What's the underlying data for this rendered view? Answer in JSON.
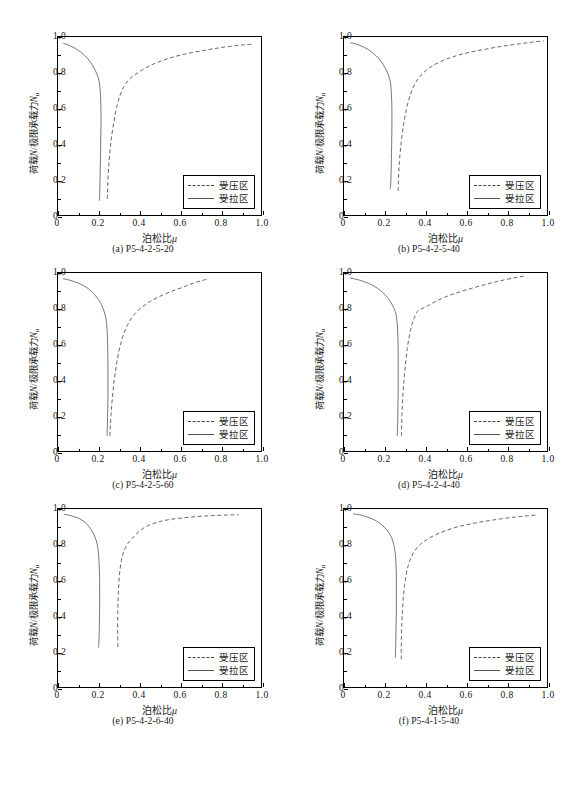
{
  "figure": {
    "axis": {
      "xlabel_cn": "泊松比",
      "xlabel_sym": "μ",
      "ylabel_cn_a": "荷载",
      "ylabel_sym_n": "N",
      "ylabel_slash": "/",
      "ylabel_cn_b": "极限承载力",
      "ylabel_sym_nu": "N",
      "ylabel_sub_u": "u",
      "xticks": [
        "0",
        "0.2",
        "0.4",
        "0.6",
        "0.8",
        "1.0"
      ],
      "yticks": [
        "0",
        "0.2",
        "0.4",
        "0.6",
        "0.8",
        "1.0"
      ]
    },
    "legend": {
      "compression": "受压区",
      "tension": "受拉区"
    },
    "colors": {
      "axis": "#000000",
      "compression_curve": "#555555",
      "tension_curve": "#666666",
      "background": "#ffffff"
    }
  },
  "chart_data": [
    {
      "type": "line",
      "panel": "a",
      "caption_index": "(a)",
      "caption_label": "P5-4-2-5-20",
      "title": "",
      "xlabel": "泊松比 μ",
      "ylabel": "荷载N/极限承载力Nu",
      "xlim": [
        0,
        1.0
      ],
      "ylim": [
        0,
        1.0
      ],
      "grid": false,
      "legend_position": "lower-right",
      "series": [
        {
          "name": "受压区",
          "style": "dashed",
          "x": [
            0.243,
            0.244,
            0.246,
            0.249,
            0.253,
            0.258,
            0.264,
            0.272,
            0.281,
            0.292,
            0.305,
            0.322,
            0.345,
            0.375,
            0.415,
            0.47,
            0.54,
            0.62,
            0.71,
            0.8,
            0.88,
            0.935,
            0.96
          ],
          "y": [
            0.09,
            0.14,
            0.2,
            0.26,
            0.32,
            0.38,
            0.44,
            0.5,
            0.56,
            0.62,
            0.67,
            0.715,
            0.755,
            0.785,
            0.815,
            0.848,
            0.878,
            0.903,
            0.923,
            0.94,
            0.952,
            0.958,
            0.96
          ]
        },
        {
          "name": "受拉区",
          "style": "solid",
          "x": [
            0.025,
            0.045,
            0.07,
            0.1,
            0.13,
            0.158,
            0.178,
            0.192,
            0.202,
            0.208,
            0.211,
            0.212,
            0.211,
            0.21,
            0.209,
            0.208,
            0.207,
            0.206,
            0.205,
            0.204
          ],
          "y": [
            0.965,
            0.958,
            0.945,
            0.925,
            0.898,
            0.862,
            0.825,
            0.79,
            0.755,
            0.7,
            0.62,
            0.53,
            0.45,
            0.38,
            0.31,
            0.25,
            0.2,
            0.155,
            0.115,
            0.08
          ]
        }
      ]
    },
    {
      "type": "line",
      "panel": "b",
      "caption_index": "(b)",
      "caption_label": "P5-4-2-5-40",
      "title": "",
      "xlabel": "泊松比 μ",
      "ylabel": "荷载N/极限承载力Nu",
      "xlim": [
        0,
        1.0
      ],
      "ylim": [
        0,
        1.0
      ],
      "grid": false,
      "legend_position": "lower-right",
      "series": [
        {
          "name": "受压区",
          "style": "dashed",
          "x": [
            0.267,
            0.268,
            0.27,
            0.273,
            0.277,
            0.282,
            0.288,
            0.295,
            0.304,
            0.315,
            0.328,
            0.344,
            0.365,
            0.392,
            0.428,
            0.475,
            0.535,
            0.61,
            0.7,
            0.79,
            0.875,
            0.94,
            0.985
          ],
          "y": [
            0.135,
            0.19,
            0.245,
            0.3,
            0.355,
            0.41,
            0.465,
            0.52,
            0.575,
            0.63,
            0.68,
            0.725,
            0.765,
            0.8,
            0.832,
            0.862,
            0.888,
            0.912,
            0.932,
            0.95,
            0.963,
            0.973,
            0.978
          ]
        },
        {
          "name": "受拉区",
          "style": "solid",
          "x": [
            0.03,
            0.055,
            0.085,
            0.115,
            0.145,
            0.172,
            0.193,
            0.21,
            0.222,
            0.23,
            0.234,
            0.236,
            0.236,
            0.235,
            0.234,
            0.233,
            0.232,
            0.231,
            0.23,
            0.228
          ],
          "y": [
            0.968,
            0.962,
            0.95,
            0.932,
            0.908,
            0.878,
            0.845,
            0.81,
            0.775,
            0.735,
            0.67,
            0.59,
            0.5,
            0.42,
            0.35,
            0.29,
            0.24,
            0.2,
            0.17,
            0.145
          ]
        }
      ]
    },
    {
      "type": "line",
      "panel": "c",
      "caption_index": "(c)",
      "caption_label": "P5-4-2-5-60",
      "title": "",
      "xlabel": "泊松比 μ",
      "ylabel": "荷载N/极限承载力Nu",
      "xlim": [
        0,
        1.0
      ],
      "ylim": [
        0,
        1.0
      ],
      "grid": false,
      "legend_position": "lower-right",
      "series": [
        {
          "name": "受压区",
          "style": "dashed",
          "x": [
            0.256,
            0.258,
            0.261,
            0.265,
            0.27,
            0.276,
            0.284,
            0.293,
            0.304,
            0.317,
            0.333,
            0.353,
            0.378,
            0.41,
            0.45,
            0.5,
            0.555,
            0.615,
            0.672,
            0.71,
            0.735
          ],
          "y": [
            0.085,
            0.14,
            0.2,
            0.26,
            0.325,
            0.39,
            0.455,
            0.52,
            0.58,
            0.635,
            0.685,
            0.73,
            0.77,
            0.805,
            0.838,
            0.868,
            0.895,
            0.92,
            0.945,
            0.958,
            0.965
          ]
        },
        {
          "name": "受拉区",
          "style": "solid",
          "x": [
            0.025,
            0.05,
            0.08,
            0.112,
            0.142,
            0.168,
            0.19,
            0.208,
            0.222,
            0.232,
            0.239,
            0.243,
            0.245,
            0.246,
            0.246,
            0.246,
            0.245,
            0.244,
            0.243,
            0.242
          ],
          "y": [
            0.968,
            0.962,
            0.952,
            0.937,
            0.918,
            0.893,
            0.865,
            0.835,
            0.8,
            0.765,
            0.72,
            0.655,
            0.57,
            0.48,
            0.39,
            0.31,
            0.24,
            0.18,
            0.13,
            0.085
          ]
        }
      ]
    },
    {
      "type": "line",
      "panel": "d",
      "caption_index": "(d)",
      "caption_label": "P5-4-2-4-40",
      "title": "",
      "xlabel": "泊松比 μ",
      "ylabel": "荷载N/极限承载力Nu",
      "xlim": [
        0,
        1.0
      ],
      "ylim": [
        0,
        1.0
      ],
      "grid": false,
      "legend_position": "lower-right",
      "series": [
        {
          "name": "受压区",
          "style": "dashed",
          "x": [
            0.283,
            0.284,
            0.286,
            0.289,
            0.293,
            0.298,
            0.304,
            0.311,
            0.32,
            0.331,
            0.345,
            0.362,
            0.384,
            0.412,
            0.448,
            0.492,
            0.545,
            0.61,
            0.685,
            0.765,
            0.835,
            0.885
          ],
          "y": [
            0.085,
            0.15,
            0.22,
            0.29,
            0.36,
            0.43,
            0.5,
            0.57,
            0.635,
            0.695,
            0.745,
            0.785,
            0.8,
            0.815,
            0.838,
            0.862,
            0.885,
            0.908,
            0.932,
            0.955,
            0.972,
            0.982
          ]
        },
        {
          "name": "受拉区",
          "style": "solid",
          "x": [
            0.028,
            0.055,
            0.088,
            0.12,
            0.15,
            0.178,
            0.202,
            0.222,
            0.238,
            0.25,
            0.258,
            0.263,
            0.266,
            0.267,
            0.267,
            0.267,
            0.266,
            0.265,
            0.264,
            0.262
          ],
          "y": [
            0.972,
            0.966,
            0.956,
            0.942,
            0.925,
            0.903,
            0.878,
            0.85,
            0.82,
            0.79,
            0.755,
            0.7,
            0.62,
            0.53,
            0.44,
            0.35,
            0.27,
            0.2,
            0.14,
            0.085
          ]
        }
      ]
    },
    {
      "type": "line",
      "panel": "e",
      "caption_index": "(e)",
      "caption_label": "P5-4-2-6-40",
      "title": "",
      "xlabel": "泊松比 μ",
      "ylabel": "荷载N/极限承载力Nu",
      "xlim": [
        0,
        1.0
      ],
      "ylim": [
        0,
        1.0
      ],
      "grid": false,
      "legend_position": "lower-right",
      "series": [
        {
          "name": "受压区",
          "style": "dashed",
          "x": [
            0.295,
            0.294,
            0.294,
            0.295,
            0.297,
            0.3,
            0.305,
            0.312,
            0.322,
            0.335,
            0.352,
            0.374,
            0.403,
            0.44,
            0.487,
            0.545,
            0.615,
            0.69,
            0.765,
            0.835,
            0.89
          ],
          "y": [
            0.225,
            0.3,
            0.375,
            0.45,
            0.52,
            0.59,
            0.655,
            0.71,
            0.755,
            0.79,
            0.818,
            0.845,
            0.878,
            0.905,
            0.925,
            0.94,
            0.95,
            0.958,
            0.963,
            0.966,
            0.968
          ]
        },
        {
          "name": "受拉区",
          "style": "solid",
          "x": [
            0.028,
            0.055,
            0.085,
            0.115,
            0.14,
            0.16,
            0.175,
            0.187,
            0.195,
            0.2,
            0.203,
            0.205,
            0.205,
            0.205,
            0.204,
            0.203,
            0.202,
            0.201,
            0.2
          ],
          "y": [
            0.97,
            0.965,
            0.955,
            0.94,
            0.918,
            0.89,
            0.86,
            0.828,
            0.79,
            0.74,
            0.68,
            0.6,
            0.52,
            0.44,
            0.37,
            0.31,
            0.27,
            0.24,
            0.222
          ]
        }
      ]
    },
    {
      "type": "line",
      "panel": "f",
      "caption_index": "(f)",
      "caption_label": "P5-4-1-5-40",
      "title": "",
      "xlabel": "泊松比 μ",
      "ylabel": "荷载N/极限承载力Nu",
      "xlim": [
        0,
        1.0
      ],
      "ylim": [
        0,
        1.0
      ],
      "grid": false,
      "legend_position": "lower-right",
      "series": [
        {
          "name": "受压区",
          "style": "dashed",
          "x": [
            0.282,
            0.282,
            0.283,
            0.285,
            0.288,
            0.292,
            0.298,
            0.306,
            0.317,
            0.331,
            0.35,
            0.375,
            0.408,
            0.45,
            0.5,
            0.56,
            0.63,
            0.7,
            0.775,
            0.845,
            0.905,
            0.945
          ],
          "y": [
            0.155,
            0.22,
            0.29,
            0.36,
            0.43,
            0.5,
            0.565,
            0.63,
            0.685,
            0.73,
            0.768,
            0.8,
            0.828,
            0.855,
            0.878,
            0.9,
            0.918,
            0.932,
            0.945,
            0.955,
            0.962,
            0.965
          ]
        },
        {
          "name": "受拉区",
          "style": "solid",
          "x": [
            0.045,
            0.075,
            0.108,
            0.14,
            0.17,
            0.197,
            0.218,
            0.234,
            0.245,
            0.252,
            0.256,
            0.258,
            0.258,
            0.258,
            0.257,
            0.256,
            0.255,
            0.254,
            0.253
          ],
          "y": [
            0.972,
            0.968,
            0.958,
            0.944,
            0.925,
            0.9,
            0.872,
            0.84,
            0.8,
            0.755,
            0.69,
            0.61,
            0.52,
            0.44,
            0.37,
            0.31,
            0.25,
            0.2,
            0.165
          ]
        }
      ]
    }
  ]
}
